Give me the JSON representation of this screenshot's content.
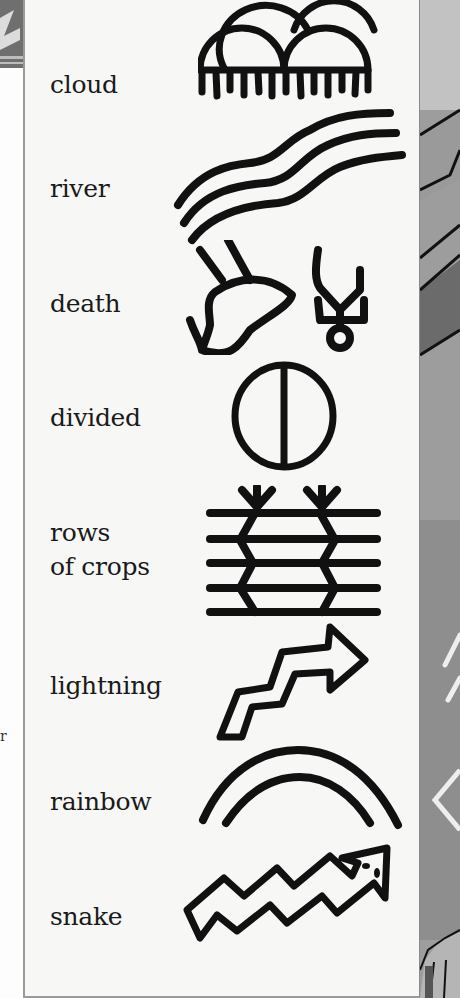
{
  "page": {
    "type": "symbol glossary",
    "background_gray": "#9d9d9d",
    "panel_color": "#f7f7f6",
    "ink_color": "#111111"
  },
  "symbols": [
    {
      "label": "cloud",
      "icon": "cloud-symbol-icon"
    },
    {
      "label": "river",
      "icon": "river-symbol-icon"
    },
    {
      "label": "death",
      "icon": "death-symbol-icon"
    },
    {
      "label": "divided",
      "icon": "divided-circle-symbol-icon"
    },
    {
      "label_line1": "rows",
      "label_line2": "of crops",
      "icon": "rows-of-crops-symbol-icon"
    },
    {
      "label": "lightning",
      "icon": "lightning-symbol-icon"
    },
    {
      "label": "rainbow",
      "icon": "rainbow-symbol-icon"
    },
    {
      "label": "snake",
      "icon": "snake-symbol-icon"
    }
  ],
  "margin_mark": "r"
}
